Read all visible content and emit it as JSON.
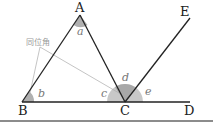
{
  "diagram": {
    "type": "geometry-triangle-exterior-angle",
    "points": {
      "A": {
        "label": "A",
        "x": 80,
        "y": 15
      },
      "B": {
        "label": "B",
        "x": 22,
        "y": 102
      },
      "C": {
        "label": "C",
        "x": 125,
        "y": 102
      },
      "D": {
        "label": "D",
        "x": 190,
        "y": 102
      },
      "E": {
        "label": "E",
        "x": 190,
        "y": 18
      }
    },
    "angles": {
      "a": "a",
      "b": "b",
      "c": "c",
      "d": "d",
      "e": "e"
    },
    "callout": {
      "text": "同位角"
    },
    "colors": {
      "line": "#222222",
      "shade": "#b0b0b0",
      "callout_line": "#aaaaaa",
      "rule": "#666666"
    }
  }
}
